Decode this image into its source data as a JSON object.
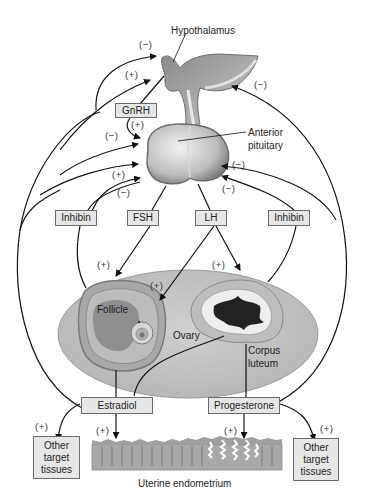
{
  "structures": {
    "hypothalamus": "Hypothalamus",
    "anterior_pituitary_line1": "Anterior",
    "anterior_pituitary_line2": "pituitary",
    "ovary": "Ovary",
    "follicle": "Follicle",
    "corpus_luteum_line1": "Corpus",
    "corpus_luteum_line2": "luteum",
    "uterine_endometrium": "Uterine endometrium"
  },
  "hormones": {
    "gnrh": "GnRH",
    "fsh": "FSH",
    "lh": "LH",
    "inhibin_left": "Inhibin",
    "inhibin_right": "Inhibin",
    "estradiol": "Estradiol",
    "progesterone": "Progesterone"
  },
  "targets": {
    "left": [
      "Other",
      "target",
      "tissues"
    ],
    "right": [
      "Other",
      "target",
      "tissues"
    ]
  },
  "signs": {
    "positive": "(+)",
    "negative": "(−)"
  },
  "colors": {
    "box_fill": "#e6e6e6",
    "box_border": "#6b6b6b",
    "ovary_fill": "#c9c9c9",
    "arrow": "#111111"
  }
}
